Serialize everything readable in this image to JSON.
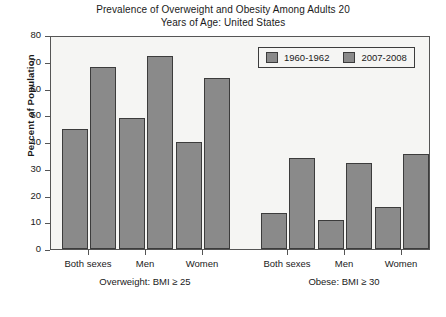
{
  "chart_data": {
    "type": "bar",
    "title": "Prevalence of Overweight and Obesity Among Adults 20 Years of Age: United States",
    "title_line1": "Prevalence of Overweight and Obesity Among Adults 20",
    "title_line2": "Years of Age: United States",
    "xlabel": "",
    "ylabel": "Percent of Population",
    "ylim": [
      0,
      80
    ],
    "yticks": [
      0,
      10,
      20,
      30,
      40,
      50,
      60,
      70,
      80
    ],
    "grid": false,
    "legend_position": "top-right",
    "categories": [
      "Both sexes",
      "Men",
      "Women",
      "Both sexes",
      "Men",
      "Women"
    ],
    "groups": [
      {
        "label": "Overweight: BMI ≥ 25",
        "categories": [
          "Both sexes",
          "Men",
          "Women"
        ]
      },
      {
        "label": "Obese: BMI ≥ 30",
        "categories": [
          "Both sexes",
          "Men",
          "Women"
        ]
      }
    ],
    "series": [
      {
        "name": "1960-1962",
        "color": "#8a8a8a",
        "values": [
          45,
          49,
          40,
          13.4,
          10.8,
          15.8
        ]
      },
      {
        "name": "2007-2008",
        "color": "#8a8a8a",
        "values": [
          68,
          72,
          64,
          34,
          32,
          35.5
        ]
      }
    ]
  },
  "legend": {
    "items": [
      {
        "label": "1960-1962",
        "swatch": "legend-swatch-1960"
      },
      {
        "label": "2007-2008",
        "swatch": "legend-swatch-2007"
      }
    ]
  },
  "colors": {
    "bar_fill": "#8a8a8a",
    "bar_stroke": "#3c3c3c",
    "plot_background": "#f5f5f3",
    "axis": "#555555",
    "text": "#1a1a1a"
  }
}
